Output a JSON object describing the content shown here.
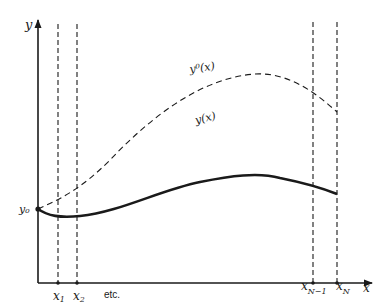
{
  "diagram": {
    "type": "function-approximation-sketch",
    "axes": {
      "x_label": "x",
      "y_label": "y"
    },
    "initial_value_label": "y₀",
    "curves": [
      {
        "id": "exact",
        "label": "y(x)",
        "style": "solid"
      },
      {
        "id": "initial-guess",
        "label": "y⁰(x)",
        "style": "dashed"
      }
    ],
    "grid_points": [
      {
        "id": "x1",
        "base": "x",
        "sub": "1"
      },
      {
        "id": "x2",
        "base": "x",
        "sub": "2"
      },
      {
        "id": "xN-1",
        "base": "x",
        "sub": "N−1"
      },
      {
        "id": "xN",
        "base": "x",
        "sub": "N"
      }
    ],
    "etc_label": "etc.",
    "colors": {
      "ink": "#1a1a1a",
      "background": "#ffffff"
    }
  }
}
